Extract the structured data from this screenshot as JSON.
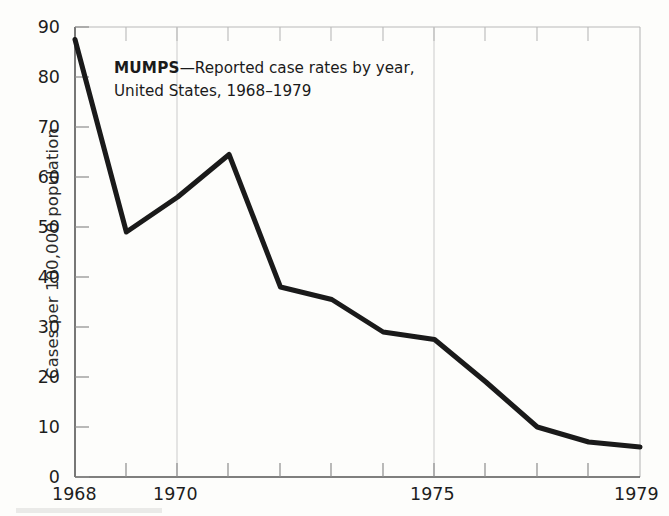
{
  "figure": {
    "background_color": "#fdfdfb",
    "line_color": "#1a1a1a",
    "axis_color": "#9a9a9a",
    "gridline_color": "#cfcfcf"
  },
  "title": {
    "disease": "MUMPS",
    "dash": "—",
    "rest": "Reported case rates by year,",
    "line2": "United States, 1968–1979"
  },
  "axes": {
    "ylabel": "Cases per 100,000 population",
    "xlabel": "",
    "yticks": [
      "0",
      "10",
      "20",
      "30",
      "40",
      "50",
      "60",
      "70",
      "80",
      "90"
    ],
    "xticks_labeled": [
      "1968",
      "1970",
      "1975",
      "1979"
    ]
  },
  "chart_data": {
    "type": "line",
    "title": "MUMPS—Reported case rates by year, United States, 1968–1979",
    "xlabel": "",
    "ylabel": "Cases per 100,000 population",
    "x": [
      1968,
      1969,
      1970,
      1971,
      1972,
      1973,
      1974,
      1975,
      1976,
      1977,
      1978,
      1979
    ],
    "values": [
      87.5,
      49.0,
      56.0,
      64.5,
      38.0,
      35.5,
      29.0,
      27.5,
      19.0,
      10.0,
      7.0,
      6.0
    ],
    "series": [
      {
        "name": "Mumps case rate",
        "values": [
          87.5,
          49.0,
          56.0,
          64.5,
          38.0,
          35.5,
          29.0,
          27.5,
          19.0,
          10.0,
          7.0,
          6.0
        ]
      }
    ],
    "xlim": [
      1968,
      1979
    ],
    "ylim": [
      0,
      90
    ],
    "ytick_step": 10,
    "xtick_labels": {
      "1968": "1968",
      "1970": "1970",
      "1975": "1975",
      "1979": "1979"
    },
    "grid": "vertical gridlines at 1970 and 1975",
    "legend": "none"
  }
}
